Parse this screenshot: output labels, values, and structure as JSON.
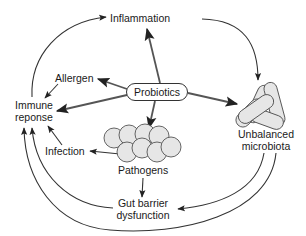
{
  "diagram": {
    "type": "concept-map",
    "nodes": {
      "probiotics": "Probiotics",
      "inflammation": "Inflammation",
      "allergen": "Allergen",
      "immune_response_line1": "Immune",
      "immune_response_line2": "reponse",
      "infection": "Infection",
      "pathogens": "Pathogens",
      "gut_barrier_line1": "Gut barrier",
      "gut_barrier_line2": "dysfunction",
      "microbiota_line1": "Unbalanced",
      "microbiota_line2": "microbiota"
    },
    "edges": [
      {
        "from": "Probiotics",
        "to": "Inflammation"
      },
      {
        "from": "Probiotics",
        "to": "Allergen"
      },
      {
        "from": "Probiotics",
        "to": "Immune reponse"
      },
      {
        "from": "Probiotics",
        "to": "Pathogens"
      },
      {
        "from": "Probiotics",
        "to": "Unbalanced microbiota"
      },
      {
        "from": "Allergen",
        "to": "Immune reponse"
      },
      {
        "from": "Immune reponse",
        "to": "Inflammation"
      },
      {
        "from": "Inflammation",
        "to": "Unbalanced microbiota"
      },
      {
        "from": "Pathogens",
        "to": "Infection"
      },
      {
        "from": "Infection",
        "to": "Immune reponse"
      },
      {
        "from": "Pathogens",
        "to": "Gut barrier dysfunction"
      },
      {
        "from": "Unbalanced microbiota",
        "to": "Gut barrier dysfunction"
      },
      {
        "from": "Unbalanced microbiota",
        "to": "Immune reponse"
      },
      {
        "from": "Gut barrier dysfunction",
        "to": "Immune reponse"
      }
    ],
    "colors": {
      "line": "#333333",
      "cell_fill": "#e6e6e6",
      "cell_stroke": "#555555"
    }
  }
}
